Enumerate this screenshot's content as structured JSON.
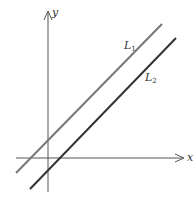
{
  "figure": {
    "axes": {
      "x_label": "x",
      "y_label": "y",
      "color": "#555555"
    },
    "lines": [
      {
        "name": "L",
        "subscript": "1",
        "color": "#777777",
        "x1": 16,
        "y1": 173,
        "x2": 162,
        "y2": 24
      },
      {
        "name": "L",
        "subscript": "2",
        "color": "#333333",
        "x1": 30,
        "y1": 189,
        "x2": 176,
        "y2": 38
      }
    ]
  },
  "chart_data": {
    "type": "line",
    "title": "",
    "xlabel": "x",
    "ylabel": "y",
    "grid": false,
    "series": [
      {
        "name": "L1",
        "slope": 1,
        "description": "parallel line with positive y-intercept"
      },
      {
        "name": "L2",
        "slope": 1,
        "description": "parallel line with negative y-intercept"
      }
    ]
  }
}
